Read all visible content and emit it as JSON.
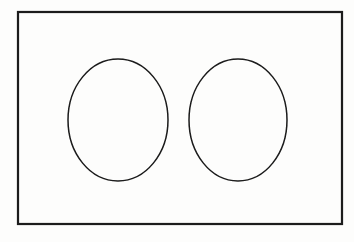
{
  "figure": {
    "title": "Rectangle containing two ellipses",
    "caption": "",
    "background_color": "#fdfdfc",
    "stroke_color": "#1a1a1a",
    "canvas": {
      "width": 354,
      "height": 242
    }
  },
  "chart_data": {
    "type": "diagram",
    "title": "Rectangle containing two ellipses",
    "xlabel": "",
    "ylabel": "",
    "grid": false,
    "legend": null,
    "xlim": [
      0,
      354
    ],
    "ylim": [
      0,
      242
    ],
    "shapes": [
      {
        "name": "outer-rectangle",
        "kind": "rectangle",
        "x": 18,
        "y": 12,
        "width": 324,
        "height": 212,
        "stroke": "#1a1a1a",
        "stroke_width": 2.2,
        "fill": "none",
        "label": ""
      },
      {
        "name": "left-ellipse",
        "kind": "ellipse",
        "cx": 118,
        "cy": 120,
        "rx": 50,
        "ry": 61,
        "stroke": "#1a1a1a",
        "stroke_width": 1.5,
        "fill": "none",
        "label": ""
      },
      {
        "name": "right-ellipse",
        "kind": "ellipse",
        "cx": 238,
        "cy": 120,
        "rx": 49,
        "ry": 61,
        "stroke": "#1a1a1a",
        "stroke_width": 1.5,
        "fill": "none",
        "label": ""
      }
    ],
    "annotations": []
  }
}
